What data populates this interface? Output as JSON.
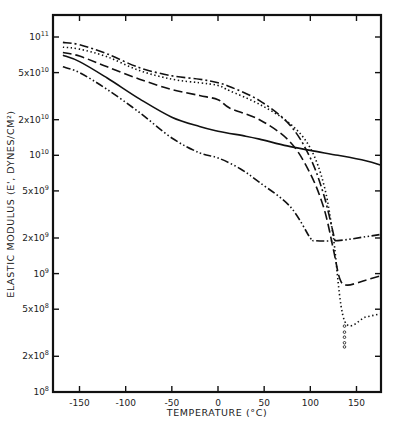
{
  "chart_data": {
    "type": "line",
    "title": "",
    "xlabel": "TEMPERATURE (°C)",
    "ylabel": "ELASTIC MODULUS (E', DYNES/CM²)",
    "xlim": [
      -178,
      177
    ],
    "ylim_log10": [
      8,
      11.19
    ],
    "yscale": "log",
    "grid": false,
    "legend": "none",
    "x_ticks": [
      {
        "value": -150,
        "label": "-150"
      },
      {
        "value": -100,
        "label": "-100"
      },
      {
        "value": -50,
        "label": "-50"
      },
      {
        "value": 0,
        "label": "0"
      },
      {
        "value": 50,
        "label": "50"
      },
      {
        "value": 100,
        "label": "100"
      },
      {
        "value": 150,
        "label": "150"
      }
    ],
    "y_ticks": [
      {
        "log10": 11,
        "base": "10",
        "exp": "11"
      },
      {
        "log10": 10.699,
        "base": "5x10",
        "exp": "10"
      },
      {
        "log10": 10.301,
        "base": "2x10",
        "exp": "10"
      },
      {
        "log10": 10,
        "base": "10",
        "exp": "10"
      },
      {
        "log10": 9.699,
        "base": "5x10",
        "exp": "9"
      },
      {
        "log10": 9.301,
        "base": "2x10",
        "exp": "9"
      },
      {
        "log10": 9,
        "base": "10",
        "exp": "9"
      },
      {
        "log10": 8.699,
        "base": "5x10",
        "exp": "8"
      },
      {
        "log10": 8.301,
        "base": "2x10",
        "exp": "8"
      },
      {
        "log10": 8,
        "base": "10",
        "exp": "8"
      }
    ],
    "series": [
      {
        "name": "solid",
        "style": "solid",
        "x": [
          -168,
          -150,
          -120,
          -85,
          -50,
          -20,
          0,
          30,
          45,
          75,
          100,
          130,
          160,
          177
        ],
        "y": [
          70000000000.0,
          62000000000.0,
          45000000000.0,
          30000000000.0,
          21000000000.0,
          17500000000.0,
          16000000000.0,
          14500000000.0,
          13700000000.0,
          12000000000.0,
          11000000000.0,
          10000000000.0,
          9000000000.0,
          8200000000.0
        ]
      },
      {
        "name": "dashed",
        "style": "dashed",
        "x": [
          -168,
          -150,
          -120,
          -85,
          -50,
          -20,
          0,
          13,
          45,
          78,
          100,
          115,
          125,
          132,
          140,
          160,
          177
        ],
        "y": [
          74000000000.0,
          69000000000.0,
          56000000000.0,
          44000000000.0,
          36000000000.0,
          32000000000.0,
          29500000000.0,
          25000000000.0,
          20000000000.0,
          13000000000.0,
          7000000000.0,
          3500000000.0,
          1600000000.0,
          900000000.0,
          800000000.0,
          880000000.0,
          960000000.0
        ]
      },
      {
        "name": "dotted",
        "style": "dotted",
        "x": [
          -168,
          -150,
          -120,
          -85,
          -50,
          -20,
          0,
          13,
          45,
          78,
          100,
          115,
          125,
          137,
          160,
          177
        ],
        "y": [
          82000000000.0,
          79000000000.0,
          68000000000.0,
          52000000000.0,
          44000000000.0,
          41000000000.0,
          39000000000.0,
          35000000000.0,
          27000000000.0,
          18500000000.0,
          11500000000.0,
          5500000000.0,
          2000000000.0,
          400000000.0,
          430000000.0,
          460000000.0
        ]
      },
      {
        "name": "dotted-tail-circles",
        "style": "circles",
        "x": [
          137,
          137,
          137,
          137,
          137
        ],
        "y": [
          360000000.0,
          320000000.0,
          290000000.0,
          260000000.0,
          240000000.0
        ]
      },
      {
        "name": "dash-dot",
        "style": "dash-dot",
        "x": [
          -168,
          -150,
          -120,
          -85,
          -50,
          -20,
          0,
          13,
          45,
          78,
          100,
          115,
          127
        ],
        "y": [
          90000000000.0,
          86000000000.0,
          72000000000.0,
          55000000000.0,
          47000000000.0,
          44000000000.0,
          41000000000.0,
          38000000000.0,
          29000000000.0,
          18000000000.0,
          9500000000.0,
          4500000000.0,
          1850000000.0
        ]
      },
      {
        "name": "dash-dot-dot",
        "style": "dash-dot-dot",
        "x": [
          -168,
          -150,
          -120,
          -85,
          -50,
          -20,
          0,
          24,
          45,
          78,
          100,
          105,
          130,
          160,
          177
        ],
        "y": [
          56000000000.0,
          50000000000.0,
          36000000000.0,
          23000000000.0,
          14000000000.0,
          10500000000.0,
          9500000000.0,
          7700000000.0,
          5900000000.0,
          3700000000.0,
          2000000000.0,
          1900000000.0,
          1900000000.0,
          2050000000.0,
          2150000000.0
        ]
      }
    ]
  }
}
